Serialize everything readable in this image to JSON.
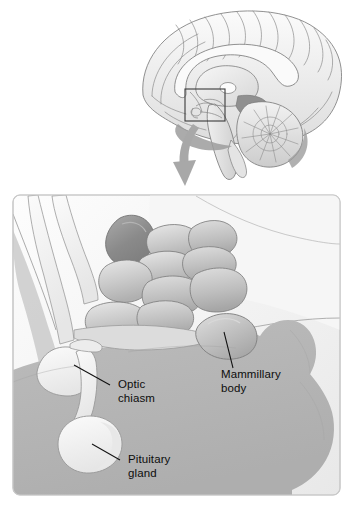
{
  "figure": {
    "kind": "anatomical-illustration",
    "width": 348,
    "height": 508
  },
  "overview": {
    "name": "midsagittal-brain-view",
    "description": "Midsagittal section of the human brain showing cerebrum, corpus callosum, brainstem and cerebellum",
    "callout_box": {
      "name": "magnification-region",
      "x": 185,
      "y": 89,
      "width": 40,
      "height": 32
    },
    "arrow": {
      "name": "magnification-arrow",
      "direction": "down",
      "color": "#a8a8a8"
    }
  },
  "detail_panel": {
    "name": "hypothalamus-detail",
    "description": "Enlarged view of the hypothalamic nuclei, optic chiasm, pituitary gland and mammillary body"
  },
  "labels": [
    {
      "id": "optic-chiasm",
      "line1": "Optic",
      "line2": "chiasm",
      "text_x": 118,
      "text_y": 388,
      "leader": "M 110 385 L 74 365"
    },
    {
      "id": "mammillary-body",
      "line1": "Mammillary",
      "line2": "body",
      "text_x": 221,
      "text_y": 378,
      "leader": "M 233 368 L 224 332"
    },
    {
      "id": "pituitary-gland",
      "line1": "Pituitary",
      "line2": "gland",
      "text_x": 128,
      "text_y": 463,
      "leader": "M 120 460 L 92 444"
    }
  ],
  "colors": {
    "background": "#ffffff",
    "panel_fill": "#f3f3f3",
    "panel_border": "#c9c9c9",
    "mid_gray": "#b4b4b4",
    "light_gray": "#e2e2e2",
    "pale": "#f0f0f0",
    "dark_gray": "#8f8f8f",
    "outline": "#6f6f6f",
    "arrow": "#a8a8a8",
    "text": "#0d0d0d"
  }
}
